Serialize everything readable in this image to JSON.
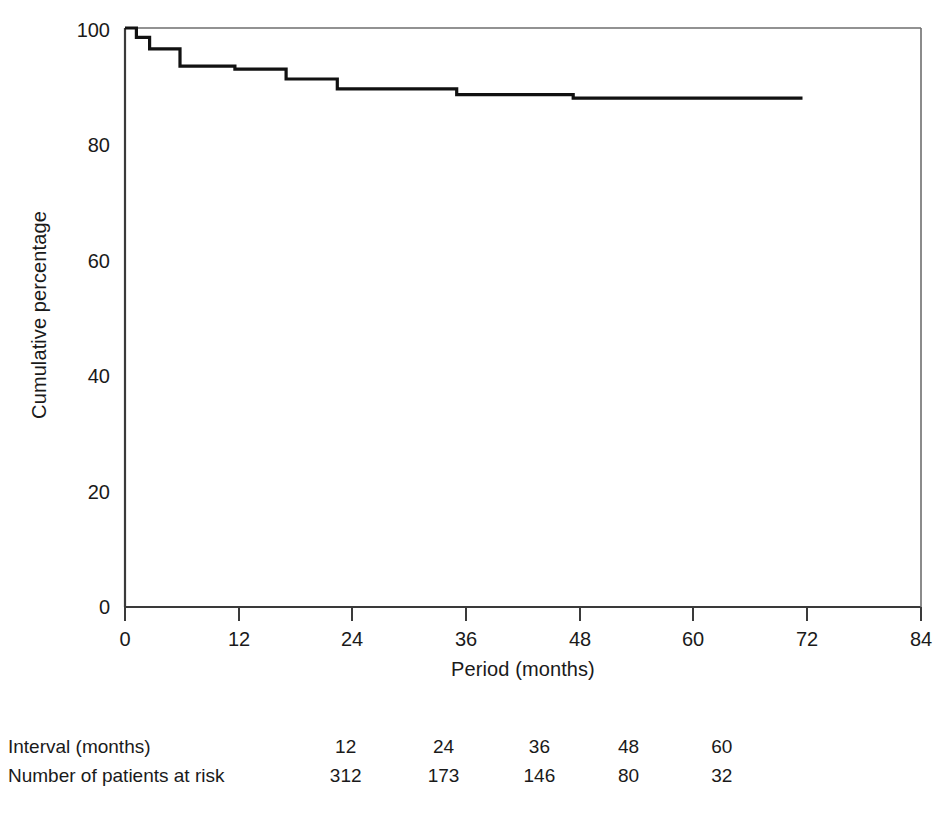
{
  "chart_data": {
    "type": "line",
    "subtype": "kaplan-meier-step",
    "title": "",
    "xlabel": "Period (months)",
    "ylabel": "Cumulative percentage",
    "xlim": [
      0,
      84
    ],
    "ylim": [
      0,
      100
    ],
    "xticks": [
      0,
      12,
      24,
      36,
      48,
      60,
      72,
      84
    ],
    "yticks": [
      0,
      20,
      40,
      60,
      80,
      100
    ],
    "grid": false,
    "legend": null,
    "line_color": "#111111",
    "series": [
      {
        "name": "Cumulative percentage",
        "x": [
          0,
          1.2,
          1.2,
          2.6,
          2.6,
          5.8,
          5.8,
          11.6,
          11.6,
          17.0,
          17.0,
          22.4,
          22.4,
          35.0,
          35.0,
          47.3,
          47.3,
          71.5
        ],
        "y": [
          100.0,
          100.0,
          98.4,
          98.4,
          96.4,
          96.4,
          93.4,
          93.4,
          92.9,
          92.9,
          91.2,
          91.2,
          89.5,
          89.5,
          88.5,
          88.5,
          87.9,
          87.9
        ]
      }
    ],
    "steps": [
      {
        "time": 0.0,
        "percent": 100.0
      },
      {
        "time": 1.2,
        "percent": 98.4
      },
      {
        "time": 2.6,
        "percent": 96.4
      },
      {
        "time": 5.8,
        "percent": 93.4
      },
      {
        "time": 11.6,
        "percent": 92.9
      },
      {
        "time": 17.0,
        "percent": 91.2
      },
      {
        "time": 22.4,
        "percent": 89.5
      },
      {
        "time": 35.0,
        "percent": 88.5
      },
      {
        "time": 47.3,
        "percent": 87.9
      },
      {
        "time": 71.5,
        "percent": 87.9
      }
    ]
  },
  "axes": {
    "ylabel": "Cumulative percentage",
    "xlabel": "Period (months)",
    "ytick_labels": [
      "100",
      "80",
      "60",
      "40",
      "20",
      "0"
    ],
    "ytick_values": [
      100,
      80,
      60,
      40,
      20,
      0
    ],
    "xtick_labels": [
      "0",
      "12",
      "24",
      "36",
      "48",
      "60",
      "72",
      "84"
    ],
    "xtick_values": [
      0,
      12,
      24,
      36,
      48,
      60,
      72,
      84
    ]
  },
  "risk_table": {
    "rows": [
      {
        "label": "Interval (months)",
        "values": [
          "12",
          "24",
          "36",
          "48",
          "60"
        ]
      },
      {
        "label": "Number of patients at risk",
        "values": [
          "312",
          "173",
          "146",
          "80",
          "32"
        ]
      }
    ]
  },
  "colors": {
    "background": "#ffffff",
    "axis": "#3a3a3a",
    "curve": "#111111",
    "text": "#1a1a1a"
  }
}
